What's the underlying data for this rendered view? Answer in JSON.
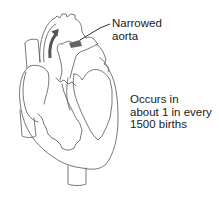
{
  "diagram": {
    "condition_highlight": "narrowed aorta",
    "labels": {
      "aorta_line1": "Narrowed",
      "aorta_line2": "aorta",
      "stats_line1": "Occurs in",
      "stats_line2": "about 1 in every",
      "stats_line3": "1500 births"
    },
    "colors": {
      "outline": "#555555",
      "arrow": "#555555",
      "narrowing": "#666666",
      "text": "#1a1a1a",
      "background": "#ffffff"
    }
  }
}
